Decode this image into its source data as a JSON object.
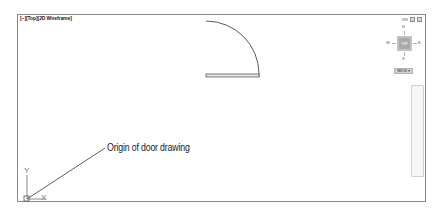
{
  "viewport": {
    "label": "[−][Top][2D Wireframe]",
    "controls": [
      "minimize",
      "restore",
      "maximize"
    ]
  },
  "viewcube": {
    "north": "N",
    "south": "S",
    "east": "E",
    "west": "W",
    "face": "TOP",
    "coordinate_system": "WCS ▾"
  },
  "ucs_icon": {
    "x_label": "X",
    "y_label": "Y"
  },
  "annotation": {
    "text": "Origin of door drawing"
  },
  "colors": {
    "frame": "#8a8a8a",
    "geometry": "#5a5a5a",
    "door_fill": "#e8e8e8",
    "leader": "#333333"
  }
}
